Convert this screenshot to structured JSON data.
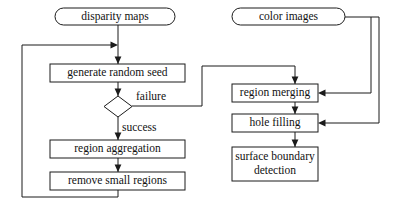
{
  "diagram": {
    "colors": {
      "background": "#ffffff",
      "stroke": "#1b1b1b",
      "text": "#111111",
      "node_fill": "#ffffff"
    },
    "nodes": {
      "disparity_maps": "disparity maps",
      "color_images": "color images",
      "generate_random_seed": "generate random seed",
      "decision": "",
      "region_aggregation": "region aggregation",
      "remove_small_regions": "remove small regions",
      "region_merging": "region merging",
      "hole_filling": "hole filling",
      "surface_boundary_line1": "surface boundary",
      "surface_boundary_line2": "detection"
    },
    "edge_labels": {
      "failure": "failure",
      "success": "success"
    }
  }
}
